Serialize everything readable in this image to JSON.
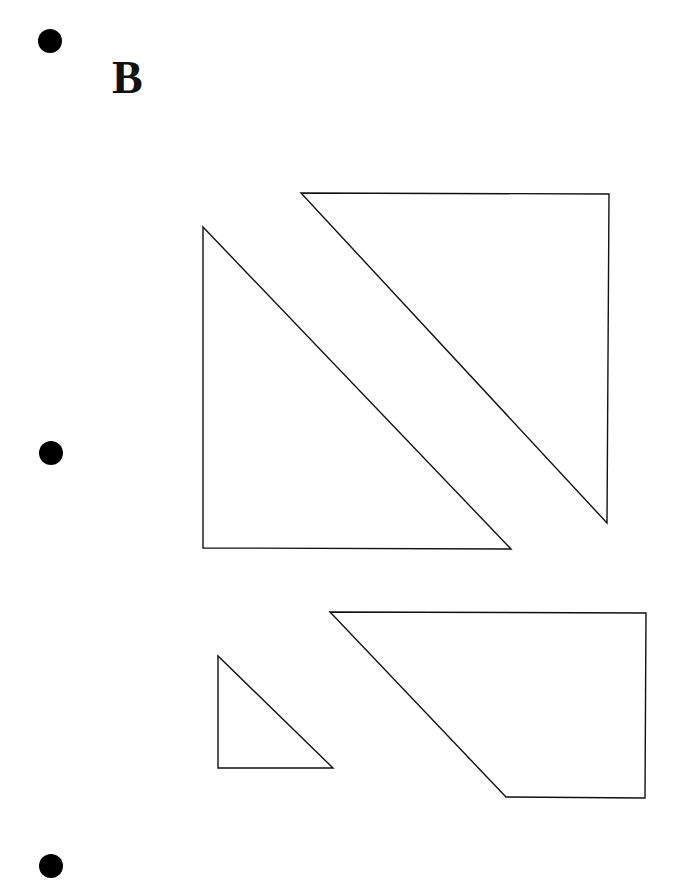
{
  "page": {
    "label": "B",
    "colors": {
      "background": "#ffffff",
      "stroke": "#111111",
      "hole_punch": "#000000"
    }
  },
  "hole_punches": [
    {
      "cx": 50,
      "cy": 41,
      "r": 12
    },
    {
      "cx": 51,
      "cy": 453,
      "r": 12
    },
    {
      "cx": 51,
      "cy": 866,
      "r": 12
    }
  ],
  "shapes": [
    {
      "name": "large-right-triangle-left",
      "points": "203,227 203,548 511,549"
    },
    {
      "name": "large-right-triangle-right",
      "points": "301,193 609,194 607,523"
    },
    {
      "name": "small-right-triangle",
      "points": "218,656 218,768 333,768"
    },
    {
      "name": "trapezoid",
      "points": "330,612 646,613 645,798 506,797"
    }
  ]
}
